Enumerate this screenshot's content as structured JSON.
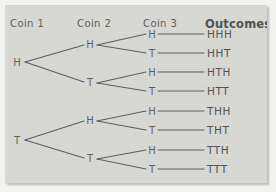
{
  "figure": {
    "background_color": "#d7d7d3",
    "ink_color": "#5a5a5a",
    "page_color": "#f2f2f0"
  },
  "headers": [
    {
      "label": "Coin 1",
      "x": 10,
      "y": 18,
      "emphasis": false
    },
    {
      "label": "Coin 2",
      "x": 77,
      "y": 18,
      "emphasis": false
    },
    {
      "label": "Coin 3",
      "x": 143,
      "y": 18,
      "emphasis": false
    },
    {
      "label": "Outcomes",
      "x": 205,
      "y": 17,
      "emphasis": true
    }
  ],
  "nodes": {
    "coin1": [
      {
        "label": "H",
        "x": 17,
        "y": 62
      },
      {
        "label": "T",
        "x": 17,
        "y": 140
      }
    ],
    "coin2": [
      {
        "label": "H",
        "x": 90,
        "y": 44
      },
      {
        "label": "T",
        "x": 90,
        "y": 82
      },
      {
        "label": "H",
        "x": 90,
        "y": 120
      },
      {
        "label": "T",
        "x": 90,
        "y": 158
      }
    ],
    "coin3": [
      {
        "label": "H",
        "x": 152,
        "y": 34
      },
      {
        "label": "T",
        "x": 152,
        "y": 53
      },
      {
        "label": "H",
        "x": 152,
        "y": 72
      },
      {
        "label": "T",
        "x": 152,
        "y": 91
      },
      {
        "label": "H",
        "x": 152,
        "y": 111
      },
      {
        "label": "T",
        "x": 152,
        "y": 130
      },
      {
        "label": "H",
        "x": 152,
        "y": 150
      },
      {
        "label": "T",
        "x": 152,
        "y": 169
      }
    ]
  },
  "outcomes": [
    {
      "label": "HHH",
      "x": 207,
      "y": 34
    },
    {
      "label": "HHT",
      "x": 207,
      "y": 53
    },
    {
      "label": "HTH",
      "x": 207,
      "y": 72
    },
    {
      "label": "HTT",
      "x": 207,
      "y": 91
    },
    {
      "label": "THH",
      "x": 207,
      "y": 111
    },
    {
      "label": "THT",
      "x": 207,
      "y": 130
    },
    {
      "label": "TTH",
      "x": 207,
      "y": 150
    },
    {
      "label": "TTT",
      "x": 207,
      "y": 169
    }
  ],
  "edges": [
    {
      "from": "coin1-H",
      "to": "coin2-H",
      "x1": 25,
      "y1": 62,
      "x2": 84,
      "y2": 45
    },
    {
      "from": "coin1-H",
      "to": "coin2-T",
      "x1": 25,
      "y1": 62,
      "x2": 84,
      "y2": 82
    },
    {
      "from": "coin1-T",
      "to": "coin2-H",
      "x1": 25,
      "y1": 140,
      "x2": 84,
      "y2": 121
    },
    {
      "from": "coin1-T",
      "to": "coin2-T",
      "x1": 25,
      "y1": 140,
      "x2": 84,
      "y2": 158
    },
    {
      "from": "coin2-H1",
      "to": "coin3-H1",
      "x1": 97,
      "y1": 45,
      "x2": 146,
      "y2": 34
    },
    {
      "from": "coin2-H1",
      "to": "coin3-T1",
      "x1": 97,
      "y1": 45,
      "x2": 146,
      "y2": 53
    },
    {
      "from": "coin2-T1",
      "to": "coin3-H2",
      "x1": 97,
      "y1": 83,
      "x2": 146,
      "y2": 72
    },
    {
      "from": "coin2-T1",
      "to": "coin3-T2",
      "x1": 97,
      "y1": 83,
      "x2": 146,
      "y2": 91
    },
    {
      "from": "coin2-H2",
      "to": "coin3-H3",
      "x1": 97,
      "y1": 121,
      "x2": 146,
      "y2": 111
    },
    {
      "from": "coin2-H2",
      "to": "coin3-T3",
      "x1": 97,
      "y1": 121,
      "x2": 146,
      "y2": 130
    },
    {
      "from": "coin2-T2",
      "to": "coin3-H4",
      "x1": 97,
      "y1": 159,
      "x2": 146,
      "y2": 150
    },
    {
      "from": "coin2-T2",
      "to": "coin3-T4",
      "x1": 97,
      "y1": 159,
      "x2": 146,
      "y2": 169
    }
  ],
  "connectors": [
    {
      "x1": 158,
      "y1": 34,
      "x2": 204,
      "y2": 34
    },
    {
      "x1": 158,
      "y1": 53,
      "x2": 204,
      "y2": 53
    },
    {
      "x1": 158,
      "y1": 72,
      "x2": 204,
      "y2": 72
    },
    {
      "x1": 158,
      "y1": 91,
      "x2": 204,
      "y2": 91
    },
    {
      "x1": 158,
      "y1": 111,
      "x2": 204,
      "y2": 111
    },
    {
      "x1": 158,
      "y1": 130,
      "x2": 204,
      "y2": 130
    },
    {
      "x1": 158,
      "y1": 150,
      "x2": 204,
      "y2": 150
    },
    {
      "x1": 158,
      "y1": 169,
      "x2": 204,
      "y2": 169
    }
  ]
}
